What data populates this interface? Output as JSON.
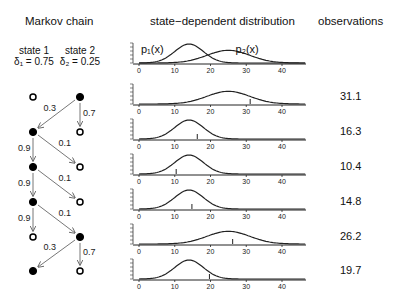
{
  "headers": {
    "markov": "Markov chain",
    "distribution": "state−dependent distribution",
    "observations": "observations"
  },
  "states": [
    {
      "name": "state 1",
      "delta_label": "δ₁ = 0.75"
    },
    {
      "name": "state 2",
      "delta_label": "δ₂ = 0.25"
    }
  ],
  "curve_labels": {
    "p1": "p₁(x)",
    "p2": "p₂(x)"
  },
  "x_ticks": [
    "0",
    "10",
    "20",
    "30",
    "40"
  ],
  "state_sequence": [
    2,
    1,
    1,
    1,
    2,
    1
  ],
  "transitions": [
    {
      "from_row": 0,
      "labels": [
        "0.3",
        "0.7"
      ]
    },
    {
      "from_row": 1,
      "labels": [
        "0.9",
        "0.1"
      ]
    },
    {
      "from_row": 2,
      "labels": [
        "0.9",
        "0.1"
      ]
    },
    {
      "from_row": 3,
      "labels": [
        "0.9",
        "0.1"
      ]
    },
    {
      "from_row": 4,
      "labels": [
        "0.3",
        "0.7"
      ]
    }
  ],
  "observations": [
    "31.1",
    "16.3",
    "10.4",
    "14.8",
    "26.2",
    "19.7"
  ],
  "observation_values": [
    31.1,
    16.3,
    10.4,
    14.8,
    26.2,
    19.7
  ],
  "distributions": {
    "p1": {
      "mean": 14,
      "sd": 4
    },
    "p2": {
      "mean": 25,
      "sd": 6
    }
  },
  "colors": {
    "ink": "#111111",
    "arrow": "#777777"
  }
}
